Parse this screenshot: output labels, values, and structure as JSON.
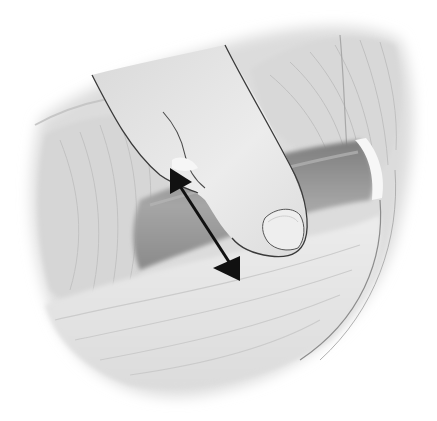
{
  "illustration": {
    "subject": "finger pressing on a muscle band beneath tendon",
    "alt": "Grayscale anatomical illustration of a fingertip pressing down on a muscle, with a double-headed arrow showing the direction of motion",
    "arrow": {
      "type": "double-headed",
      "color": "#111111",
      "start": [
        170,
        168
      ],
      "end": [
        240,
        280
      ]
    },
    "palette": {
      "background": "#ffffff",
      "muscle_light": "#e6e6e6",
      "muscle_mid": "#cfcfcf",
      "muscle_dark": "#9a9a9a",
      "finger": "#e9e9e9",
      "outline": "#3a3a3a"
    }
  }
}
